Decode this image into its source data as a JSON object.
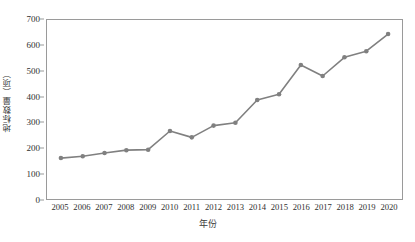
{
  "chart_data": {
    "type": "line",
    "title": "",
    "xlabel": "年份",
    "ylabel": "地标数量（项）",
    "categories": [
      "2005",
      "2006",
      "2007",
      "2008",
      "2009",
      "2010",
      "2011",
      "2012",
      "2013",
      "2014",
      "2015",
      "2016",
      "2017",
      "2018",
      "2019",
      "2020"
    ],
    "values": [
      160,
      167,
      180,
      191,
      193,
      266,
      241,
      287,
      298,
      387,
      410,
      524,
      481,
      554,
      578,
      645
    ],
    "series": [
      {
        "name": "地标数量",
        "values": [
          160,
          167,
          180,
          191,
          193,
          266,
          241,
          287,
          298,
          387,
          410,
          524,
          481,
          554,
          578,
          645
        ]
      }
    ],
    "ylim": [
      0,
      700
    ],
    "y_ticks": [
      0,
      100,
      200,
      300,
      400,
      500,
      600,
      700
    ],
    "y_tick_labels": [
      "0",
      "100",
      "200",
      "300",
      "400",
      "500",
      "600",
      "700"
    ],
    "grid": false,
    "legend": false,
    "legend_position": "none",
    "marker": "circle",
    "line_color": "#808080",
    "marker_color": "#808080",
    "frame_color": "#9a9a9a",
    "background_color": "#ffffff"
  }
}
